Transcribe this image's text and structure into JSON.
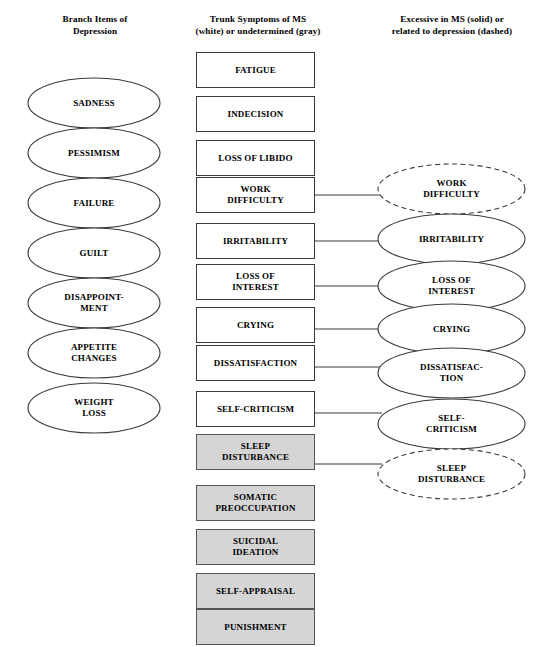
{
  "headers": {
    "left": "Branch Items of\nDepression",
    "middle": "Trunk Symptoms of MS\n(white) or undetermined (gray)",
    "right": "Excessive in MS (solid) or\nrelated to depression (dashed)"
  },
  "colors": {
    "box_white_fill": "#ffffff",
    "box_gray_fill": "#d5d5d5",
    "stroke": "#3a3a3a",
    "text": "#000000"
  },
  "branch_items": [
    {
      "label": "SADNESS",
      "shape": "ellipse",
      "style": "solid",
      "top": 77
    },
    {
      "label": "PESSIMISM",
      "shape": "ellipse",
      "style": "solid",
      "top": 127
    },
    {
      "label": "FAILURE",
      "shape": "ellipse",
      "style": "solid",
      "top": 177
    },
    {
      "label": "GUILT",
      "shape": "ellipse",
      "style": "solid",
      "top": 227
    },
    {
      "label": "DISAPPOINT-\nMENT",
      "shape": "ellipse",
      "style": "solid",
      "top": 277
    },
    {
      "label": "APPETITE\nCHANGES",
      "shape": "ellipse",
      "style": "solid",
      "top": 327
    },
    {
      "label": "WEIGHT\nLOSS",
      "shape": "ellipse",
      "style": "solid",
      "top": 382
    }
  ],
  "trunk_symptoms": [
    {
      "label": "FATIGUE",
      "fill": "white",
      "top": 52
    },
    {
      "label": "INDECISION",
      "fill": "white",
      "top": 96
    },
    {
      "label": "LOSS OF LIBIDO",
      "fill": "white",
      "top": 140
    },
    {
      "label": "WORK\nDIFFICULTY",
      "fill": "white",
      "top": 177
    },
    {
      "label": "IRRITABILITY",
      "fill": "white",
      "top": 223
    },
    {
      "label": "LOSS OF\nINTEREST",
      "fill": "white",
      "top": 264
    },
    {
      "label": "CRYING",
      "fill": "white",
      "top": 307
    },
    {
      "label": "DISSATISFACTION",
      "fill": "white",
      "top": 345
    },
    {
      "label": "SELF-CRITICISM",
      "fill": "white",
      "top": 391
    },
    {
      "label": "SLEEP\nDISTURBANCE",
      "fill": "gray",
      "top": 434
    },
    {
      "label": "SOMATIC\nPREOCCUPATION",
      "fill": "gray",
      "top": 485
    },
    {
      "label": "SUICIDAL\nIDEATION",
      "fill": "gray",
      "top": 529
    },
    {
      "label": "SELF-APPRAISAL",
      "fill": "gray",
      "top": 573
    },
    {
      "label": "PUNISHMENT",
      "fill": "gray",
      "top": 609
    }
  ],
  "excessive_items": [
    {
      "label": "WORK\nDIFFICULTY",
      "shape": "ellipse",
      "style": "dashed",
      "top": 163
    },
    {
      "label": "IRRITABILITY",
      "shape": "ellipse",
      "style": "solid",
      "top": 213
    },
    {
      "label": "LOSS OF\nINTEREST",
      "shape": "ellipse",
      "style": "solid",
      "top": 260
    },
    {
      "label": "CRYING",
      "shape": "ellipse",
      "style": "solid",
      "top": 303
    },
    {
      "label": "DISSATISFAC-\nTION",
      "shape": "ellipse",
      "style": "solid",
      "top": 347
    },
    {
      "label": "SELF-\nCRITICISM",
      "shape": "ellipse",
      "style": "solid",
      "top": 398
    },
    {
      "label": "SLEEP\nDISTURBANCE",
      "shape": "ellipse",
      "style": "dashed",
      "top": 448
    }
  ],
  "connectors": [
    {
      "from": "WORK DIFFICULTY",
      "to": "WORK DIFFICULTY",
      "y": 195
    },
    {
      "from": "IRRITABILITY",
      "to": "IRRITABILITY",
      "y": 241
    },
    {
      "from": "LOSS OF INTEREST",
      "to": "LOSS OF INTEREST",
      "y": 286
    },
    {
      "from": "CRYING",
      "to": "CRYING",
      "y": 329
    },
    {
      "from": "DISSATISFACTION",
      "to": "DISSATISFACTION",
      "y": 367
    },
    {
      "from": "SELF-CRITICISM",
      "to": "SELF-CRITICISM",
      "y": 413
    },
    {
      "from": "SLEEP DISTURBANCE",
      "to": "SLEEP DISTURBANCE",
      "y": 464
    }
  ]
}
